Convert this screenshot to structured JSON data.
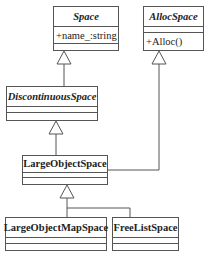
{
  "diagram": {
    "type": "uml-class",
    "classes": [
      {
        "id": "space",
        "name": "Space",
        "abstract": true,
        "attributes": [
          "+name_:string"
        ],
        "methods": []
      },
      {
        "id": "allocspace",
        "name": "AllocSpace",
        "abstract": true,
        "attributes": [],
        "methods": [
          "+Alloc()"
        ]
      },
      {
        "id": "discontinuous",
        "name": "DiscontinuousSpace",
        "abstract": true,
        "attributes": [],
        "methods": []
      },
      {
        "id": "largeobject",
        "name": "LargeObjectSpace",
        "abstract": false,
        "attributes": [],
        "methods": []
      },
      {
        "id": "largeobjectmap",
        "name": "LargeObjectMapSpace",
        "abstract": false,
        "attributes": [],
        "methods": []
      },
      {
        "id": "freelist",
        "name": "FreeListSpace",
        "abstract": false,
        "attributes": [],
        "methods": []
      }
    ],
    "relations": [
      {
        "type": "generalization",
        "from": "DiscontinuousSpace",
        "to": "Space"
      },
      {
        "type": "generalization",
        "from": "LargeObjectSpace",
        "to": "DiscontinuousSpace"
      },
      {
        "type": "generalization",
        "from": "LargeObjectSpace",
        "to": "AllocSpace"
      },
      {
        "type": "generalization",
        "from": "LargeObjectMapSpace",
        "to": "LargeObjectSpace"
      },
      {
        "type": "generalization",
        "from": "FreeListSpace",
        "to": "LargeObjectSpace"
      }
    ]
  },
  "labels": {
    "space": {
      "name": "Space",
      "attr0": "+name_:string"
    },
    "allocspace": {
      "name": "AllocSpace",
      "method0": "+Alloc()"
    },
    "discontinuous": {
      "name": "DiscontinuousSpace"
    },
    "largeobject": {
      "name": "LargeObjectSpace"
    },
    "largeobjectmap": {
      "name": "LargeObjectMapSpace"
    },
    "freelist": {
      "name": "FreeListSpace"
    }
  }
}
